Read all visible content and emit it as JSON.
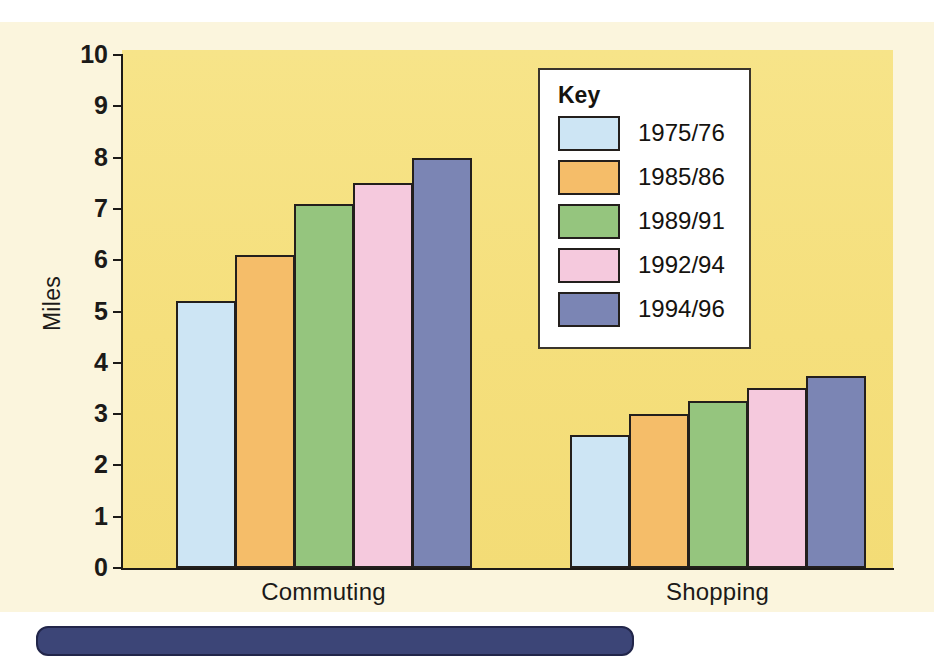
{
  "chart_data": {
    "type": "bar",
    "title": "",
    "xlabel": "",
    "ylabel": "Miles",
    "ylim": [
      0,
      10
    ],
    "ytick_labels": [
      "10",
      "9",
      "8",
      "7",
      "6",
      "5",
      "4",
      "3",
      "2",
      "1",
      "0"
    ],
    "ytick_values": [
      10,
      9,
      8,
      7,
      6,
      5,
      4,
      3,
      2,
      1,
      0
    ],
    "grid": false,
    "legend_position": "inside-upper-right",
    "legend_title": "Key",
    "categories": [
      "Commuting",
      "Shopping"
    ],
    "series": [
      {
        "name": "1975/76",
        "color": "#cde5f4",
        "values": [
          5.2,
          2.6
        ]
      },
      {
        "name": "1985/86",
        "color": "#f5bd69",
        "values": [
          6.1,
          3.0
        ]
      },
      {
        "name": "1989/91",
        "color": "#95c57e",
        "values": [
          7.1,
          3.25
        ]
      },
      {
        "name": "1992/94",
        "color": "#f5c9dd",
        "values": [
          7.5,
          3.5
        ]
      },
      {
        "name": "1994/96",
        "color": "#7b85b4",
        "values": [
          8.0,
          3.75
        ]
      }
    ]
  },
  "colors": {
    "plot_background": "#f5df7c",
    "page_background": "#fbf5dd",
    "axis": "#1c1a17",
    "bar_outline": "#231f1c",
    "legend_background": "#ffffff",
    "bottom_strip": "#3c4577"
  }
}
